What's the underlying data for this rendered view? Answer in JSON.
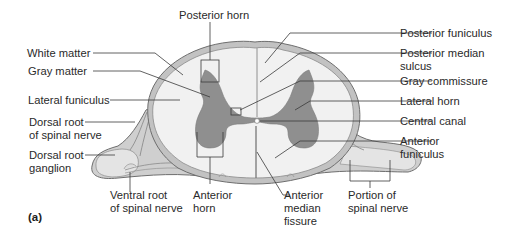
{
  "figure": {
    "panel_label": "(a)",
    "colors": {
      "white_matter": "#f1f1f1",
      "gray_matter": "#8f8f8f",
      "meninges": "#bdbdbd",
      "outline": "#6e6e6e",
      "nerve_fill": "#e2e2e2",
      "root_shade": "#c4c4c4",
      "label_text": "#2a2a2a"
    }
  },
  "labels": {
    "posterior_horn": "Posterior horn",
    "white_matter": "White matter",
    "gray_matter": "Gray matter",
    "lateral_funiculus": "Lateral funiculus",
    "dorsal_root_line1": "Dorsal root",
    "dorsal_root_line2": "of spinal nerve",
    "dorsal_ganglion_line1": "Dorsal root",
    "dorsal_ganglion_line2": "ganglion",
    "ventral_root_line1": "Ventral root",
    "ventral_root_line2": "of spinal nerve",
    "anterior_horn_line1": "Anterior",
    "anterior_horn_line2": "horn",
    "anterior_median_line1": "Anterior",
    "anterior_median_line2": "median",
    "anterior_median_line3": "fissure",
    "portion_line1": "Portion of",
    "portion_line2": "spinal nerve",
    "posterior_funiculus": "Posterior funiculus",
    "posterior_median_line1": "Posterior median",
    "posterior_median_line2": "sulcus",
    "gray_commissure": "Gray commissure",
    "lateral_horn": "Lateral horn",
    "central_canal": "Central canal",
    "anterior_funiculus_line1": "Anterior",
    "anterior_funiculus_line2": "funiculus"
  }
}
